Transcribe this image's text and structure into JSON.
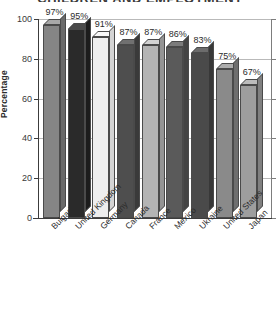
{
  "chart_data": {
    "type": "bar",
    "title": "CHILDREN AND EMPLOYMENT",
    "xlabel": "",
    "ylabel": "Percentage",
    "ylim": [
      0,
      100
    ],
    "yticks": [
      0,
      20,
      40,
      60,
      80,
      100
    ],
    "grid": true,
    "legend": "none",
    "categories": [
      "Bulgaria",
      "United Kingdom",
      "Germany",
      "Canada",
      "France",
      "Mexico",
      "Ukraine",
      "United States",
      "Japan"
    ],
    "values": [
      97,
      95,
      91,
      87,
      87,
      86,
      83,
      75,
      67
    ],
    "data_labels": [
      "97%",
      "95%",
      "91%",
      "87%",
      "87%",
      "86%",
      "83%",
      "75%",
      "67%"
    ],
    "bar_colors": [
      "#858585",
      "#2a2a2a",
      "#eeeeee",
      "#4e4e4e",
      "#b4b4b4",
      "#5a5a5a",
      "#4a4a4a",
      "#8a8a8a",
      "#9e9e9e"
    ],
    "bar_top_colors": [
      "#a8a8a8",
      "#4a4a4a",
      "#f8f8f8",
      "#707070",
      "#d2d2d2",
      "#7c7c7c",
      "#6c6c6c",
      "#acacac",
      "#bcbcbc"
    ],
    "bar_side_colors": [
      "#6a6a6a",
      "#1c1c1c",
      "#d4d4d4",
      "#3a3a3a",
      "#949494",
      "#444444",
      "#383838",
      "#6e6e6e",
      "#808080"
    ]
  },
  "axis": {
    "tick_labels": [
      "0",
      "20",
      "40",
      "60",
      "80",
      "100"
    ]
  }
}
